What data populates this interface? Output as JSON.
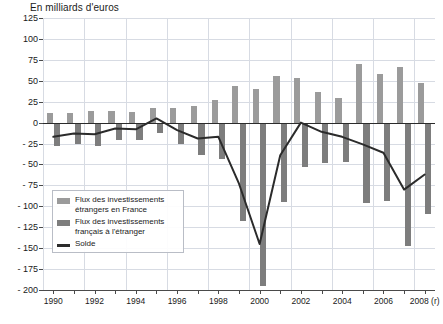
{
  "chart_data": {
    "type": "bar",
    "title": "En milliards d'euros",
    "xlabel": "",
    "ylabel": "",
    "ylim": [
      -200,
      125
    ],
    "ytick_step": 25,
    "yticks": [
      125,
      100,
      75,
      50,
      25,
      0,
      -25,
      -50,
      -75,
      -100,
      -125,
      -150,
      -175,
      -200
    ],
    "ytick_labels": [
      "125",
      "100",
      "75",
      "50",
      "25",
      "0",
      "- 25",
      "- 50",
      "- 75",
      "- 100",
      "- 125",
      "- 150",
      "- 175",
      "- 200"
    ],
    "grid": true,
    "legend_position": "inside-lower-left",
    "categories": [
      1990,
      1991,
      1992,
      1993,
      1994,
      1995,
      1996,
      1997,
      1998,
      1999,
      2000,
      2001,
      2002,
      2003,
      2004,
      2005,
      2006,
      2007,
      2008
    ],
    "xtick_labels": [
      "1990",
      "",
      "1992",
      "",
      "1994",
      "",
      "1996",
      "",
      "1998",
      "",
      "2000",
      "",
      "2002",
      "",
      "2004",
      "",
      "2006",
      "",
      "2008 (r)"
    ],
    "series": [
      {
        "name": "Flux des investissements étrangers en France",
        "key": "inward",
        "color": "#9b9b9b",
        "values": [
          11,
          12,
          14,
          14,
          13,
          18,
          17,
          20,
          27,
          44,
          40,
          56,
          53,
          37,
          30,
          70,
          58,
          67,
          47
        ]
      },
      {
        "name": "Flux des investissements français à l'étranger",
        "key": "outward",
        "color": "#7d7d7d",
        "values": [
          -28,
          -25,
          -28,
          -21,
          -21,
          -13,
          -26,
          -39,
          -44,
          -117,
          -195,
          -95,
          -53,
          -48,
          -47,
          -96,
          -94,
          -147,
          -109
        ]
      },
      {
        "name": "Solde",
        "key": "solde",
        "type": "line",
        "color": "#2b2b2b",
        "values": [
          -17,
          -13,
          -14,
          -7,
          -8,
          5,
          -9,
          -19,
          -17,
          -73,
          -145,
          -39,
          0,
          -11,
          -17,
          -26,
          -36,
          -80,
          -62
        ]
      }
    ]
  },
  "legend": {
    "items": [
      {
        "label_line1": "Flux des investissements",
        "label_line2": "étrangers en France",
        "swatch": "bar-inward"
      },
      {
        "label_line1": "Flux des investissements",
        "label_line2": "français à l'étranger",
        "swatch": "bar-outward"
      },
      {
        "label_line1": "Solde",
        "label_line2": "",
        "swatch": "line-solde"
      }
    ]
  }
}
